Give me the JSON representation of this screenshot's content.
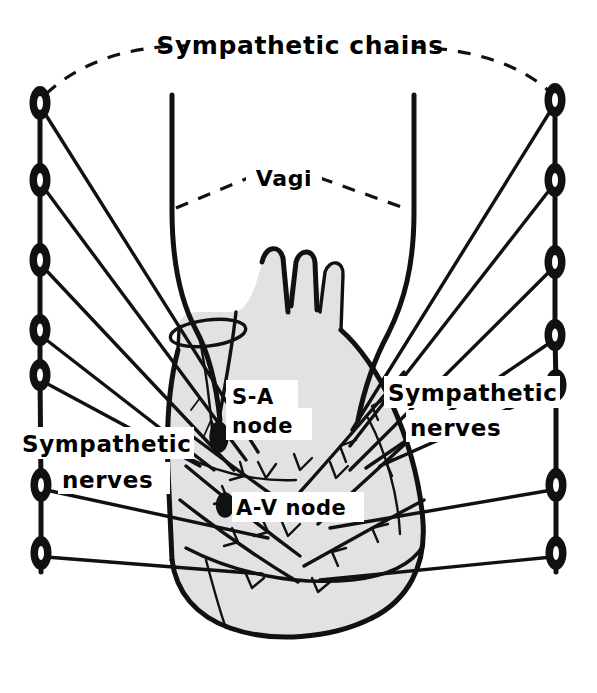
{
  "figure": {
    "title": "Sympathetic chains",
    "kind": "anatomical-line-diagram",
    "background_color": "#ffffff",
    "ink_color": "#111111",
    "heart_fill_color": "#e2e2e2"
  },
  "labels": {
    "sympathetic_chains": "Sympathetic chains",
    "vagi": "Vagi",
    "sa_node_line1": "S-A",
    "sa_node_line2": "node",
    "av_node": "A-V node",
    "sympathetic_nerves_left_line1": "Sympathetic",
    "sympathetic_nerves_left_line2": "nerves",
    "sympathetic_nerves_right_line1": "Sympathetic",
    "sympathetic_nerves_right_line2": "nerves"
  },
  "structures": {
    "left_chain": {
      "name": "left sympathetic chain",
      "ganglion_count": 7,
      "ganglion_y": [
        103,
        180,
        260,
        330,
        375,
        485,
        553
      ],
      "x": 40
    },
    "right_chain": {
      "name": "right sympathetic chain",
      "ganglion_count": 7,
      "ganglion_y": [
        100,
        180,
        262,
        335,
        385,
        485,
        553
      ],
      "x": 555
    },
    "vagus_trunks": {
      "name": "vagus nerve trunks",
      "count": 2,
      "left_x": 172,
      "right_x": 414,
      "top_y": 95
    },
    "sa_node": {
      "name": "sino-atrial node",
      "x": 219,
      "y": 437
    },
    "av_node": {
      "name": "atrio-ventricular node",
      "x": 225,
      "y": 505
    },
    "heart": {
      "name": "heart",
      "great_vessel_stumps": 3
    },
    "superior_vena_cava": {
      "name": "superior vena cava"
    }
  }
}
